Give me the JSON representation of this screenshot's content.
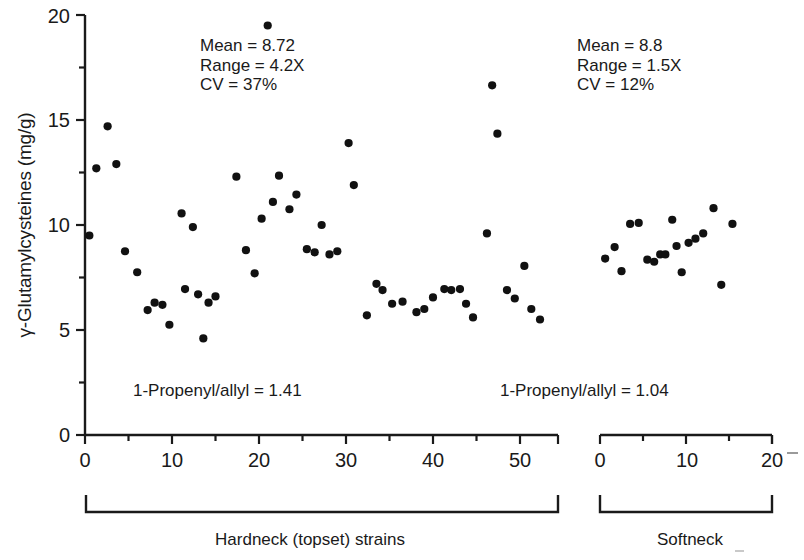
{
  "axes": {
    "ylabel": "γ-Glutamylcysteines (mg/g)",
    "y_ticks": [
      "0",
      "5",
      "10",
      "15",
      "20"
    ],
    "x_ticks_left": [
      "0",
      "10",
      "20",
      "30",
      "40",
      "50"
    ],
    "x_ticks_right": [
      "0",
      "10",
      "20"
    ]
  },
  "annotations": {
    "hardneck_stats": {
      "mean": "Mean = 8.72",
      "range": "Range = 4.2X",
      "cv": "CV = 37%"
    },
    "softneck_stats": {
      "mean": "Mean = 8.8",
      "range": "Range = 1.5X",
      "cv": "CV = 12%"
    },
    "hardneck_ratio": "1-Propenyl/allyl = 1.41",
    "softneck_ratio": "1-Propenyl/allyl = 1.04"
  },
  "group_labels": {
    "hardneck": "Hardneck (topset) strains",
    "softneck": "Softneck"
  },
  "colors": {
    "marker": "#111111",
    "axis": "#1a1a1a",
    "background": "#ffffff"
  },
  "chart_data": {
    "type": "scatter",
    "title": "",
    "xlabel": "",
    "ylabel": "γ-Glutamylcysteines (mg/g)",
    "ylim": [
      0,
      20
    ],
    "grid": false,
    "legend": "none",
    "panels": [
      {
        "name": "Hardneck (topset) strains",
        "xlabel": "Strain number",
        "xlim": [
          0,
          54
        ],
        "x_ticks": [
          0,
          10,
          20,
          30,
          40,
          50
        ],
        "mean": 8.72,
        "range_fold": 4.2,
        "cv_percent": 37,
        "propenyl_allyl_ratio": 1.41,
        "n": 46,
        "points": [
          [
            0.5,
            9.5
          ],
          [
            1.3,
            12.7
          ],
          [
            2.6,
            14.7
          ],
          [
            3.6,
            12.9
          ],
          [
            4.6,
            8.75
          ],
          [
            6.0,
            7.75
          ],
          [
            7.2,
            5.95
          ],
          [
            8.0,
            6.3
          ],
          [
            8.9,
            6.2
          ],
          [
            9.7,
            5.25
          ],
          [
            11.1,
            10.55
          ],
          [
            11.5,
            6.95
          ],
          [
            12.4,
            9.9
          ],
          [
            13.0,
            6.7
          ],
          [
            13.6,
            4.6
          ],
          [
            14.2,
            6.3
          ],
          [
            15.0,
            6.6
          ],
          [
            17.4,
            12.3
          ],
          [
            18.5,
            8.8
          ],
          [
            19.5,
            7.7
          ],
          [
            20.3,
            10.3
          ],
          [
            21.0,
            19.5
          ],
          [
            21.6,
            11.1
          ],
          [
            22.3,
            12.35
          ],
          [
            23.5,
            10.75
          ],
          [
            24.3,
            11.45
          ],
          [
            25.5,
            8.85
          ],
          [
            26.4,
            8.7
          ],
          [
            27.2,
            10.0
          ],
          [
            28.1,
            8.6
          ],
          [
            29.0,
            8.75
          ],
          [
            30.3,
            13.9
          ],
          [
            30.9,
            11.9
          ],
          [
            32.4,
            5.7
          ],
          [
            33.5,
            7.2
          ],
          [
            34.2,
            6.9
          ],
          [
            35.3,
            6.25
          ],
          [
            36.5,
            6.35
          ],
          [
            38.1,
            5.85
          ],
          [
            39.0,
            6.0
          ],
          [
            40.0,
            6.55
          ],
          [
            41.3,
            6.95
          ],
          [
            42.1,
            6.9
          ],
          [
            43.1,
            6.95
          ],
          [
            43.8,
            6.25
          ],
          [
            44.6,
            5.6
          ],
          [
            46.2,
            9.6
          ],
          [
            46.8,
            16.65
          ],
          [
            47.4,
            14.35
          ],
          [
            48.5,
            6.9
          ],
          [
            49.4,
            6.5
          ],
          [
            50.5,
            8.05
          ],
          [
            51.3,
            6.0
          ],
          [
            52.3,
            5.5
          ]
        ]
      },
      {
        "name": "Softneck",
        "xlabel": "Strain number",
        "xlim": [
          0,
          20
        ],
        "x_ticks": [
          0,
          10,
          20
        ],
        "mean": 8.8,
        "range_fold": 1.5,
        "cv_percent": 12,
        "propenyl_allyl_ratio": 1.04,
        "n": 18,
        "points": [
          [
            0.6,
            8.4
          ],
          [
            1.7,
            8.95
          ],
          [
            2.5,
            7.8
          ],
          [
            3.5,
            10.05
          ],
          [
            4.5,
            10.1
          ],
          [
            5.5,
            8.35
          ],
          [
            6.3,
            8.25
          ],
          [
            7.0,
            8.6
          ],
          [
            7.6,
            8.6
          ],
          [
            8.4,
            10.25
          ],
          [
            8.9,
            9.0
          ],
          [
            9.5,
            7.75
          ],
          [
            10.3,
            9.15
          ],
          [
            11.1,
            9.35
          ],
          [
            12.0,
            9.6
          ],
          [
            13.2,
            10.8
          ],
          [
            14.1,
            7.15
          ],
          [
            15.4,
            10.05
          ]
        ]
      }
    ]
  }
}
